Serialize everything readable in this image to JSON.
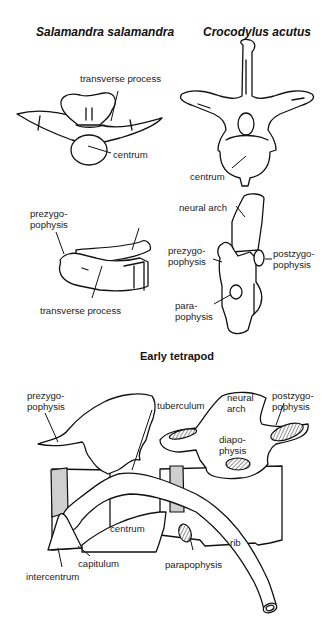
{
  "panels": {
    "salamandra": {
      "title": "Salamandra salamandra",
      "labels": {
        "transverse_process_top": "transverse process",
        "centrum": "centrum",
        "prezygapophysis": "prezygo-\npophysis",
        "postzygapophysis": "postzygopophysis",
        "transverse_process_bottom": "transverse process"
      }
    },
    "crocodylus": {
      "title": "Crocodylus acutus",
      "labels": {
        "centrum": "centrum",
        "neural_arch": "neural arch",
        "prezygapophysis": "prezygo-\npophysis",
        "postzygapophysis": "postzygo-\npophysis",
        "parapophysis": "para-\npophysis"
      }
    },
    "early_tetrapod": {
      "title": "Early tetrapod",
      "labels": {
        "prezygapophysis": "prezygo-\npophysis",
        "tuberculum": "tuberculum",
        "neural_arch": "neural\narch",
        "postzygapophysis": "postzygo-\npophysis",
        "diapophysis": "diapo-\nphysis",
        "centrum": "centrum",
        "rib": "rib",
        "capitulum": "capitulum",
        "parapophysis": "parapophysis",
        "intercentrum": "intercentrum"
      }
    }
  },
  "colors": {
    "line": "#111111",
    "intercentrum_fill": "#cfcfcf",
    "articular_hatch": "#555555",
    "background": "#ffffff"
  }
}
